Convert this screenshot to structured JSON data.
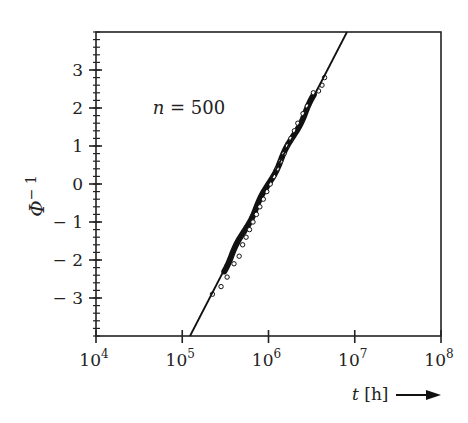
{
  "chart_data": {
    "type": "scatter",
    "title": "",
    "xlabel": "t [h]",
    "ylabel": "Φ⁻¹",
    "x_scale": "log",
    "xlim": [
      10000,
      100000000
    ],
    "ylim": [
      -4,
      4
    ],
    "x_ticks": [
      10000,
      100000,
      1000000,
      10000000,
      100000000
    ],
    "x_tick_labels": [
      {
        "base": "10",
        "exp": "4"
      },
      {
        "base": "10",
        "exp": "5"
      },
      {
        "base": "10",
        "exp": "6"
      },
      {
        "base": "10",
        "exp": "7"
      },
      {
        "base": "10",
        "exp": "8"
      }
    ],
    "y_ticks": [
      -3,
      -2,
      -1,
      0,
      1,
      2,
      3
    ],
    "y_tick_labels": [
      "− 3",
      "− 2",
      "− 1",
      "0",
      "1",
      "2",
      "3"
    ],
    "y_minor_step": 0.2,
    "grid": false,
    "annotation": {
      "var": "n",
      "text": " = 500",
      "x_log": 4.75,
      "y": 2.0
    },
    "fit_line": {
      "name": "lognormal fit",
      "points_log10x": [
        5.09,
        6.91
      ],
      "points_y": [
        -4.0,
        4.0
      ]
    },
    "series": [
      {
        "name": "samples (n = 500)",
        "marker": "circle-open",
        "log10x": [
          5.35,
          5.45,
          5.52,
          5.6,
          5.66,
          5.7,
          5.74,
          5.78,
          5.82,
          5.86,
          5.9,
          5.94,
          5.98,
          6.02,
          6.06,
          6.1,
          6.14,
          6.18,
          6.22,
          6.26,
          6.3,
          6.34,
          6.4,
          6.45,
          6.52,
          6.58,
          6.62,
          6.65
        ],
        "y": [
          -2.9,
          -2.7,
          -2.45,
          -2.1,
          -1.9,
          -1.6,
          -1.4,
          -1.2,
          -1.0,
          -0.8,
          -0.6,
          -0.4,
          -0.2,
          0.0,
          0.2,
          0.4,
          0.6,
          0.8,
          1.0,
          1.2,
          1.4,
          1.6,
          1.85,
          2.05,
          2.4,
          2.45,
          2.6,
          2.8
        ]
      }
    ],
    "legend": null
  },
  "labels": {
    "xlabel_var": "t",
    "xlabel_unit": " [h]",
    "ylabel_base": "Φ",
    "ylabel_exp": "− 1"
  }
}
